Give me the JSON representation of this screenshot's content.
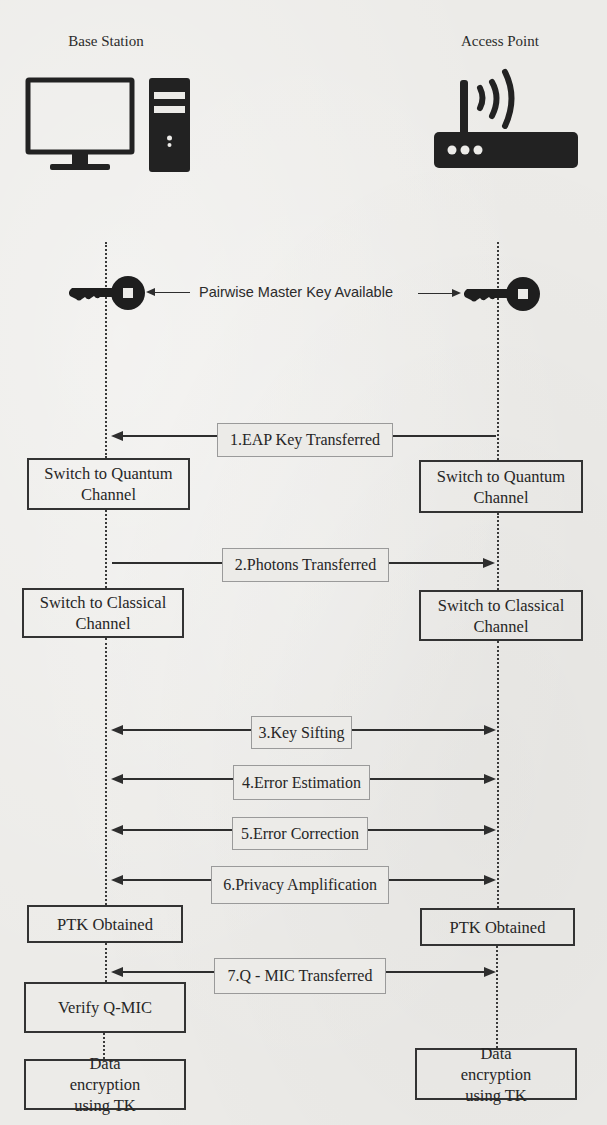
{
  "diagram": {
    "type": "sequence",
    "actors": {
      "left": {
        "label": "Base Station",
        "icon": "desktop-computer-icon"
      },
      "right": {
        "label": "Access Point",
        "icon": "wifi-router-icon"
      }
    },
    "pmk": {
      "label": "Pairwise Master Key Available",
      "icon": "key-icon"
    },
    "messages": [
      {
        "step": 1,
        "label": "1.EAP Key Transferred",
        "direction": "right-to-left"
      },
      {
        "step": 2,
        "label": "2.Photons Transferred",
        "direction": "left-to-right"
      },
      {
        "step": 3,
        "label": "3.Key Sifting",
        "direction": "bidirectional"
      },
      {
        "step": 4,
        "label": "4.Error Estimation",
        "direction": "bidirectional"
      },
      {
        "step": 5,
        "label": "5.Error Correction",
        "direction": "bidirectional"
      },
      {
        "step": 6,
        "label": "6.Privacy Amplification",
        "direction": "bidirectional"
      },
      {
        "step": 7,
        "label": "7.Q - MIC Transferred",
        "direction": "bidirectional"
      }
    ],
    "states": {
      "left": {
        "quantum": "Switch to Quantum Channel",
        "classical": "Switch to Classical Channel",
        "ptk": "PTK Obtained",
        "verify": "Verify Q-MIC",
        "encrypt": "Data encryption using TK"
      },
      "right": {
        "quantum": "Switch to Quantum Channel",
        "classical": "Switch to Classical Channel",
        "ptk": "PTK Obtained",
        "encrypt": "Data encryption using TK"
      }
    }
  },
  "colors": {
    "background": "#ecebe8",
    "ink": "#2e2e2e",
    "label_border": "#9a9a9a"
  }
}
